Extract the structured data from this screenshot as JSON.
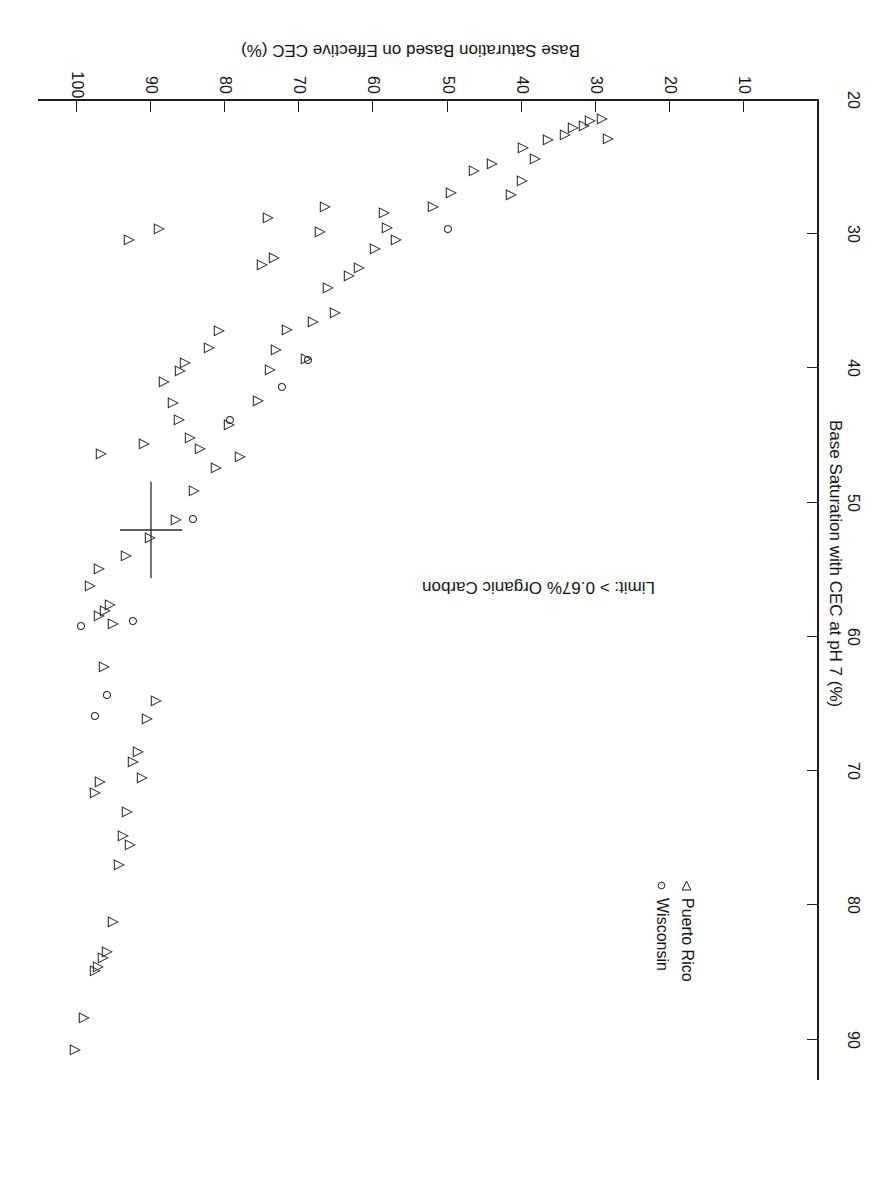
{
  "figure": {
    "rotation_deg": 180,
    "background": "#ffffff",
    "ink_color": "#1d1d1d"
  },
  "legend": {
    "position": "upper-left",
    "entries": [
      {
        "marker": "triangle-left-open",
        "label": "Puerto Rico"
      },
      {
        "marker": "circle-open",
        "label": "Wisconsin"
      }
    ]
  },
  "annotation": {
    "text": "Limit: > 0.67% Organic Carbon"
  },
  "chart_data": {
    "type": "scatter",
    "title": "",
    "xlabel": "Base Saturation Based on Effective CEC (%)",
    "ylabel": "Base Saturation with CEC at pH 7 (%)",
    "xlim": [
      0,
      105
    ],
    "ylim": [
      20,
      93
    ],
    "xticks": [
      10,
      20,
      30,
      40,
      50,
      60,
      70,
      80,
      90,
      100
    ],
    "yticks": [
      20,
      30,
      40,
      50,
      60,
      70,
      80,
      90
    ],
    "grid": false,
    "legend_position": "upper left",
    "annotations": [
      {
        "text": "Limit: > 0.67% Organic Carbon",
        "x": 22,
        "y": 57
      }
    ],
    "reference_marker": {
      "type": "plus-cross",
      "x": 90,
      "y": 52,
      "x_halfwidth": 4.2,
      "y_halfwidth": 3.6
    },
    "series": [
      {
        "name": "Puerto Rico",
        "marker": "triangle-left-open",
        "points": [
          [
            100.3,
            90.8
          ],
          [
            99.1,
            88.4
          ],
          [
            97.2,
            84.6
          ],
          [
            97.6,
            84.9
          ],
          [
            96.5,
            83.9
          ],
          [
            96.0,
            83.5
          ],
          [
            95.2,
            81.2
          ],
          [
            94.3,
            77.0
          ],
          [
            93.8,
            74.8
          ],
          [
            92.8,
            75.5
          ],
          [
            93.2,
            73.0
          ],
          [
            91.8,
            68.6
          ],
          [
            92.4,
            69.3
          ],
          [
            91.2,
            70.5
          ],
          [
            90.6,
            66.1
          ],
          [
            89.3,
            64.8
          ],
          [
            97.6,
            71.6
          ],
          [
            96.9,
            70.8
          ],
          [
            96.4,
            62.2
          ],
          [
            95.2,
            59.0
          ],
          [
            97.0,
            58.4
          ],
          [
            96.2,
            58.1
          ],
          [
            95.6,
            57.6
          ],
          [
            98.2,
            56.2
          ],
          [
            97.0,
            54.9
          ],
          [
            93.4,
            54.0
          ],
          [
            90.1,
            52.6
          ],
          [
            86.6,
            51.3
          ],
          [
            84.2,
            49.1
          ],
          [
            83.4,
            46.0
          ],
          [
            81.2,
            47.4
          ],
          [
            79.5,
            44.2
          ],
          [
            78.0,
            46.6
          ],
          [
            75.6,
            42.4
          ],
          [
            74.0,
            40.1
          ],
          [
            73.2,
            38.6
          ],
          [
            71.6,
            37.1
          ],
          [
            69.1,
            39.3
          ],
          [
            68.2,
            36.5
          ],
          [
            66.1,
            34.0
          ],
          [
            65.2,
            35.9
          ],
          [
            63.3,
            33.1
          ],
          [
            62.0,
            32.5
          ],
          [
            59.8,
            31.1
          ],
          [
            58.2,
            29.5
          ],
          [
            57.0,
            30.4
          ],
          [
            52.0,
            28.0
          ],
          [
            49.5,
            26.9
          ],
          [
            46.4,
            25.3
          ],
          [
            44.0,
            24.8
          ],
          [
            41.4,
            27.1
          ],
          [
            40.0,
            26.0
          ],
          [
            39.8,
            23.6
          ],
          [
            38.2,
            24.4
          ],
          [
            36.5,
            23.0
          ],
          [
            34.2,
            22.6
          ],
          [
            33.0,
            22.1
          ],
          [
            31.6,
            21.9
          ],
          [
            30.8,
            21.6
          ],
          [
            29.2,
            21.4
          ],
          [
            28.4,
            22.9
          ],
          [
            86.1,
            40.2
          ],
          [
            85.4,
            39.6
          ],
          [
            88.2,
            41.0
          ],
          [
            82.2,
            38.5
          ],
          [
            80.8,
            37.2
          ],
          [
            75.0,
            32.3
          ],
          [
            73.4,
            31.8
          ],
          [
            67.2,
            29.8
          ],
          [
            58.6,
            28.4
          ],
          [
            93.0,
            30.4
          ],
          [
            89.0,
            29.6
          ],
          [
            74.2,
            28.8
          ],
          [
            66.5,
            28.0
          ],
          [
            87.0,
            42.6
          ],
          [
            86.2,
            43.8
          ],
          [
            84.8,
            45.2
          ],
          [
            91.0,
            45.6
          ],
          [
            96.8,
            46.4
          ]
        ]
      },
      {
        "name": "Wisconsin",
        "marker": "circle-open",
        "points": [
          [
            97.6,
            65.9
          ],
          [
            96.0,
            64.3
          ],
          [
            99.4,
            59.2
          ],
          [
            92.5,
            58.8
          ],
          [
            84.4,
            51.2
          ],
          [
            79.4,
            43.8
          ],
          [
            72.4,
            41.4
          ],
          [
            68.8,
            39.4
          ],
          [
            50.0,
            29.6
          ]
        ]
      }
    ]
  }
}
